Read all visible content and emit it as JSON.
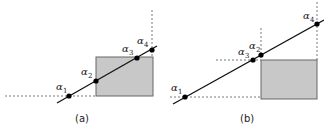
{
  "figure": {
    "panels": [
      {
        "id": "a",
        "caption": "(a)",
        "rect": {
          "x": 96,
          "y": 57,
          "w": 57,
          "h": 39,
          "fill": "#c8c8c8",
          "stroke": "#666666"
        },
        "line": {
          "x1": 57,
          "y1": 103,
          "x2": 157,
          "y2": 46
        },
        "dashed": [
          {
            "x1": 5,
            "y1": 96,
            "x2": 96,
            "y2": 96
          },
          {
            "x1": 152,
            "y1": 10,
            "x2": 152,
            "y2": 57
          }
        ],
        "points": [
          {
            "name": "alpha",
            "sub": "1",
            "x": 69,
            "y": 96,
            "lx": 56,
            "ly": 90
          },
          {
            "name": "alpha",
            "sub": "2",
            "x": 96,
            "y": 81,
            "lx": 81,
            "ly": 75
          },
          {
            "name": "alpha",
            "sub": "3",
            "x": 137,
            "y": 58,
            "lx": 122,
            "ly": 52
          },
          {
            "name": "alpha",
            "sub": "4",
            "x": 152,
            "y": 50,
            "lx": 137,
            "ly": 44
          }
        ],
        "caption_pos": {
          "x": 75,
          "y": 122
        }
      },
      {
        "id": "b",
        "caption": "(b)",
        "rect": {
          "x": 261,
          "y": 60,
          "w": 56,
          "h": 39,
          "fill": "#c8c8c8",
          "stroke": "#666666"
        },
        "line": {
          "x1": 173,
          "y1": 104,
          "x2": 324,
          "y2": 20
        },
        "dashed": [
          {
            "x1": 170,
            "y1": 97,
            "x2": 261,
            "y2": 97
          },
          {
            "x1": 216,
            "y1": 60,
            "x2": 261,
            "y2": 60
          },
          {
            "x1": 261,
            "y1": 28,
            "x2": 261,
            "y2": 60
          },
          {
            "x1": 317,
            "y1": 2,
            "x2": 317,
            "y2": 60
          }
        ],
        "points": [
          {
            "name": "alpha",
            "sub": "1",
            "x": 185,
            "y": 97,
            "lx": 171,
            "ly": 91
          },
          {
            "name": "alpha",
            "sub": "2",
            "x": 261,
            "y": 55,
            "lx": 249,
            "ly": 49
          },
          {
            "name": "alpha",
            "sub": "3",
            "x": 253,
            "y": 60,
            "lx": 238,
            "ly": 55
          },
          {
            "name": "alpha",
            "sub": "4",
            "x": 317,
            "y": 24,
            "lx": 303,
            "ly": 19
          }
        ],
        "caption_pos": {
          "x": 240,
          "y": 122
        }
      }
    ],
    "symbol": "α"
  }
}
